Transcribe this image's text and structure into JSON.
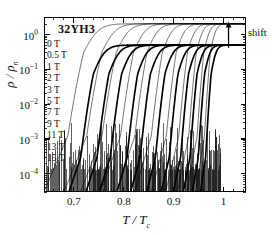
{
  "figure": {
    "sample_title": "32YH3",
    "shift_annotation": "shift",
    "background": "#ffffff",
    "line_color": "#000000"
  },
  "chart_data": {
    "type": "line",
    "title": "32YH3",
    "xlabel": "T / T_c",
    "ylabel": "ρ / ρ_n",
    "yscale": "log",
    "xlim": [
      0.64,
      1.045
    ],
    "ylim": [
      3e-05,
      3.2
    ],
    "xticks": [
      0.7,
      0.8,
      0.9,
      1
    ],
    "xtick_labels": [
      "0.7",
      "0.8",
      "0.9",
      "1"
    ],
    "yticks": [
      1,
      0.1,
      0.01,
      0.001,
      0.0001
    ],
    "ytick_labels": [
      "10^0",
      "10^-1",
      "10^-2",
      "10^-3",
      "10^-4"
    ],
    "grid": false,
    "legend_position": "upper-left-inside",
    "annotations": [
      {
        "text": "shift",
        "x": 1.01,
        "y": 1.7,
        "arrow": "up"
      }
    ],
    "legend_entries": [
      "0 T",
      "0.5 T",
      "1 T",
      "2 T",
      "3 T",
      "5 T",
      "7 T",
      "9 T",
      "11 T",
      "13 T",
      "15 T"
    ],
    "series": [
      {
        "name": "0 T",
        "field_T": 0,
        "style": "thick",
        "midpoint": 0.757,
        "width": 0.032,
        "plateau": 0.5,
        "foot": 0.735
      },
      {
        "name": "0.5 T",
        "field_T": 0.5,
        "style": "thick",
        "midpoint": 0.787,
        "width": 0.03,
        "plateau": 0.5,
        "foot": 0.766
      },
      {
        "name": "1 T",
        "field_T": 1,
        "style": "thick",
        "midpoint": 0.812,
        "width": 0.029,
        "plateau": 0.5,
        "foot": 0.792
      },
      {
        "name": "2 T",
        "field_T": 2,
        "style": "thick",
        "midpoint": 0.843,
        "width": 0.027,
        "plateau": 0.5,
        "foot": 0.824
      },
      {
        "name": "3 T",
        "field_T": 3,
        "style": "thick",
        "midpoint": 0.868,
        "width": 0.026,
        "plateau": 0.5,
        "foot": 0.85
      },
      {
        "name": "5 T",
        "field_T": 5,
        "style": "thick",
        "midpoint": 0.896,
        "width": 0.024,
        "plateau": 0.5,
        "foot": 0.879
      },
      {
        "name": "7 T",
        "field_T": 7,
        "style": "thick",
        "midpoint": 0.921,
        "width": 0.022,
        "plateau": 0.5,
        "foot": 0.906
      },
      {
        "name": "9 T",
        "field_T": 9,
        "style": "thick",
        "midpoint": 0.941,
        "width": 0.02,
        "plateau": 0.5,
        "foot": 0.928
      },
      {
        "name": "11 T",
        "field_T": 11,
        "style": "thick",
        "midpoint": 0.957,
        "width": 0.018,
        "plateau": 0.5,
        "foot": 0.945
      },
      {
        "name": "13 T",
        "field_T": 13,
        "style": "thick",
        "midpoint": 0.971,
        "width": 0.016,
        "plateau": 0.5,
        "foot": 0.96
      },
      {
        "name": "15 T",
        "field_T": 15,
        "style": "thick",
        "midpoint": 0.983,
        "width": 0.014,
        "plateau": 0.5,
        "foot": 0.973
      },
      {
        "name": "0 T shifted",
        "field_T": 0,
        "style": "thin",
        "midpoint": 0.742,
        "width": 0.04,
        "plateau": 2.05,
        "foot": 0.716
      },
      {
        "name": "0.5 T shifted",
        "field_T": 0.5,
        "style": "thin",
        "midpoint": 0.777,
        "width": 0.038,
        "plateau": 2.05,
        "foot": 0.752
      },
      {
        "name": "1 T shifted",
        "field_T": 1,
        "style": "thin",
        "midpoint": 0.805,
        "width": 0.036,
        "plateau": 2.05,
        "foot": 0.781
      },
      {
        "name": "2 T shifted",
        "field_T": 2,
        "style": "thin",
        "midpoint": 0.838,
        "width": 0.033,
        "plateau": 2.05,
        "foot": 0.816
      },
      {
        "name": "3 T shifted",
        "field_T": 3,
        "style": "thin",
        "midpoint": 0.864,
        "width": 0.031,
        "plateau": 2.05,
        "foot": 0.844
      },
      {
        "name": "5 T shifted",
        "field_T": 5,
        "style": "thin",
        "midpoint": 0.893,
        "width": 0.028,
        "plateau": 2.05,
        "foot": 0.875
      },
      {
        "name": "7 T shifted",
        "field_T": 7,
        "style": "thin",
        "midpoint": 0.919,
        "width": 0.025,
        "plateau": 2.05,
        "foot": 0.903
      },
      {
        "name": "9 T shifted",
        "field_T": 9,
        "style": "thin",
        "midpoint": 0.94,
        "width": 0.022,
        "plateau": 2.05,
        "foot": 0.926
      },
      {
        "name": "11 T shifted",
        "field_T": 11,
        "style": "thin",
        "midpoint": 0.956,
        "width": 0.019,
        "plateau": 2.05,
        "foot": 0.944
      },
      {
        "name": "13 T shifted",
        "field_T": 13,
        "style": "thin",
        "midpoint": 0.97,
        "width": 0.017,
        "plateau": 2.05,
        "foot": 0.959
      },
      {
        "name": "15 T shifted",
        "field_T": 15,
        "style": "thin",
        "midpoint": 0.982,
        "width": 0.015,
        "plateau": 2.05,
        "foot": 0.972
      }
    ],
    "noise_floor": {
      "description": "dense measurement noise spikes near resolution limit",
      "y_base": 0.00013,
      "y_peak_max": 0.003,
      "x_range": [
        0.645,
        0.995
      ]
    }
  }
}
